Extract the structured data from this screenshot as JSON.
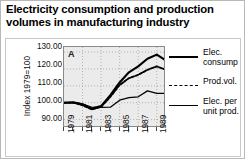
{
  "title": "Electricity consumption and production volumes in manufacturing industry",
  "panel_label": "A",
  "axes": {
    "ylabel": "Index 1979=100",
    "yticks": [
      "130.00",
      "120.00",
      "110.00",
      "100.00",
      "90.00"
    ],
    "xticks": [
      "1979",
      "1981",
      "1983",
      "1985",
      "1987",
      "1989"
    ]
  },
  "legend": {
    "items": [
      {
        "label": "Elec. consump",
        "style": "solid-thick"
      },
      {
        "label": "Prod.vol.",
        "style": "dashed"
      },
      {
        "label": "Elec. per unit prod.",
        "style": "solid-thin"
      }
    ]
  },
  "chart_data": {
    "type": "line",
    "title": "Electricity consumption and production volumes in manufacturing industry",
    "xlabel": "",
    "ylabel": "Index 1979=100",
    "ylim": [
      85,
      133
    ],
    "xlim": [
      1979,
      1990
    ],
    "grid": true,
    "grid_style": "dotted",
    "legend_position": "right",
    "x": [
      1979,
      1980,
      1981,
      1982,
      1983,
      1984,
      1985,
      1986,
      1987,
      1988,
      1989,
      1990
    ],
    "series": [
      {
        "name": "Elec. consump",
        "style": "solid-thick",
        "values": [
          100.0,
          100.3,
          99.0,
          96.5,
          98.0,
          104.5,
          112.0,
          118.0,
          121.5,
          126.0,
          128.5,
          125.0
        ]
      },
      {
        "name": "Prod.vol.",
        "style": "dashed",
        "values": [
          100.0,
          100.0,
          98.5,
          96.0,
          97.5,
          103.5,
          110.5,
          114.5,
          116.5,
          119.5,
          121.5,
          119.5
        ]
      },
      {
        "name": "Elec. per unit prod.",
        "style": "solid-thin",
        "values": [
          100.0,
          100.0,
          99.3,
          97.3,
          97.2,
          97.3,
          101.5,
          103.0,
          103.5,
          107.0,
          105.5,
          105.5
        ]
      }
    ]
  }
}
